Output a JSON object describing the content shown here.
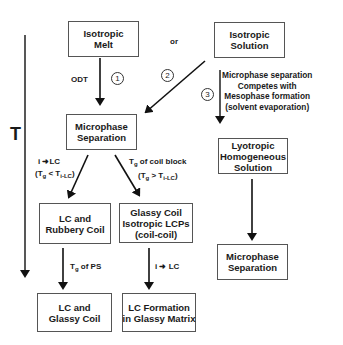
{
  "axis": {
    "label": "T"
  },
  "or_label": "or",
  "boxes": {
    "isotropic_melt": [
      "Isotropic",
      "Melt"
    ],
    "isotropic_solution": [
      "Isotropic",
      "Solution"
    ],
    "microphase_left": [
      "Microphase",
      "Separation"
    ],
    "lc_rubbery": [
      "LC and",
      "Rubbery Coil"
    ],
    "glassy_coil": [
      "Glassy Coil",
      "Isotropic LCPs",
      "(coil-coil)"
    ],
    "lc_glassy": [
      "LC and",
      "Glassy Coil"
    ],
    "lc_formation": [
      "LC Formation",
      "in Glassy Matrix"
    ],
    "lyotropic": [
      "Lyotropic",
      "Homogeneous",
      "Solution"
    ],
    "microphase_right": [
      "Microphase",
      "Separation"
    ]
  },
  "routes": {
    "r1": "1",
    "r2": "2",
    "r3": "3"
  },
  "labels": {
    "odt": "ODT",
    "route3": [
      "Microphase separation",
      "Competes with",
      "Mesophase formation",
      "(solvent evaporation)"
    ],
    "i_to_lc": {
      "i": "i",
      "arrow": "➜",
      "lc": "LC"
    },
    "tg_lt": {
      "open": "(T",
      "g": "g",
      "op": " < T",
      "sub": "i-LC",
      "close": ")"
    },
    "tg_coil": {
      "t": "T",
      "g": "g",
      "rest": " of coil block"
    },
    "tg_gt": {
      "open": "(T",
      "g": "g",
      "op": " > T",
      "sub": "i-LC",
      "close": ")"
    },
    "tg_ps": {
      "t": "T",
      "g": "g",
      "rest": " of PS"
    },
    "i_to_lc_2": {
      "i": "i",
      "arrow": "➜",
      "lc": "LC"
    }
  },
  "colors": {
    "line": "#111111",
    "box_border": "#555555"
  }
}
